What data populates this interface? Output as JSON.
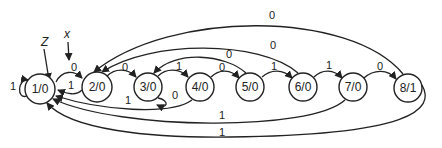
{
  "diagram": {
    "type": "state-diagram",
    "inputs": {
      "z_label": "Z",
      "x_label": "x"
    },
    "nodes": [
      {
        "id": "s1",
        "label": "1/0",
        "cx": 40,
        "cy": 89
      },
      {
        "id": "s2",
        "label": "2/0",
        "cx": 97,
        "cy": 87
      },
      {
        "id": "s3",
        "label": "3/0",
        "cx": 148,
        "cy": 87
      },
      {
        "id": "s4",
        "label": "4/0",
        "cx": 200,
        "cy": 87
      },
      {
        "id": "s5",
        "label": "5/0",
        "cx": 250,
        "cy": 87
      },
      {
        "id": "s6",
        "label": "6/0",
        "cx": 303,
        "cy": 87
      },
      {
        "id": "s7",
        "label": "7/0",
        "cx": 353,
        "cy": 87
      },
      {
        "id": "s8",
        "label": "8/1",
        "cx": 408,
        "cy": 88
      }
    ],
    "edges": [
      {
        "from": "1/0",
        "to": "1/0",
        "label": "1"
      },
      {
        "from": "1/0",
        "to": "2/0",
        "label": "0"
      },
      {
        "from": "2/0",
        "to": "1/0",
        "label": "1"
      },
      {
        "from": "2/0",
        "to": "3/0",
        "label": "0"
      },
      {
        "from": "3/0",
        "to": "3/0",
        "label": "0"
      },
      {
        "from": "3/0",
        "to": "4/0",
        "label": "1"
      },
      {
        "from": "4/0",
        "to": "1/0",
        "label": "1"
      },
      {
        "from": "4/0",
        "to": "5/0",
        "label": "0"
      },
      {
        "from": "5/0",
        "to": "3/0",
        "label": "0"
      },
      {
        "from": "5/0",
        "to": "6/0",
        "label": "1"
      },
      {
        "from": "6/0",
        "to": "2/0",
        "label": "0"
      },
      {
        "from": "6/0",
        "to": "7/0",
        "label": "1"
      },
      {
        "from": "7/0",
        "to": "8/1",
        "label": "0"
      },
      {
        "from": "7/0",
        "to": "1/0",
        "label": "1"
      },
      {
        "from": "8/1",
        "to": "2/0",
        "label": "0"
      },
      {
        "from": "8/1",
        "to": "1/0",
        "label": "1"
      }
    ],
    "edge_labels": {
      "e11": "1",
      "e12": "0",
      "e21": "1",
      "e23": "0",
      "e33": "0",
      "e34": "1",
      "e41": "1",
      "e45": "0",
      "e53": "0",
      "e56": "1",
      "e62": "0",
      "e67": "1",
      "e78": "0",
      "e71": "1",
      "e82": "0",
      "e81": "1"
    },
    "colors": {
      "stroke": "#222222",
      "background": "#ffffff"
    }
  }
}
